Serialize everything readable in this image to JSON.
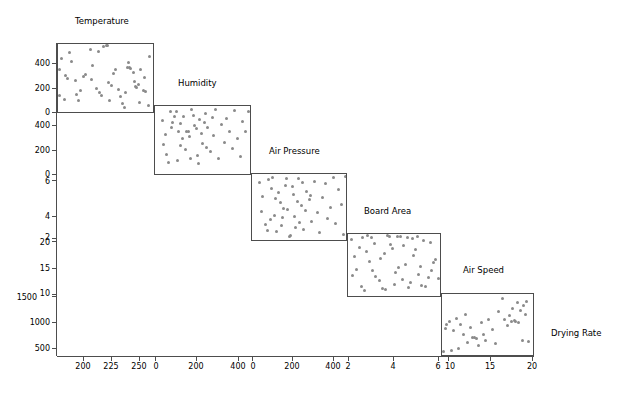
{
  "figure": {
    "type": "scatterplot-matrix",
    "background": "#ffffff",
    "point_color": "#8a8a8a",
    "frame_color": "#4d4d4d",
    "width": 640,
    "height": 396
  },
  "chart_data": {
    "type": "scatter",
    "title": "",
    "subtitle": "",
    "xlabel": "",
    "ylabel": "",
    "grid": false,
    "legend": "none",
    "layout": "staircase scatterplot matrix (lower-diagonal cascade), 5 scatter panels",
    "variables": [
      {
        "name": "Temperature",
        "role": "x-axis of panel 1",
        "ticks": [
          200,
          225,
          250
        ],
        "range": [
          185,
          262
        ]
      },
      {
        "name": "Humidity",
        "role": "y-axis of panel 1 / x-axis of panel 2",
        "ticks": [
          0,
          200,
          400
        ],
        "range": [
          -30,
          500
        ]
      },
      {
        "name": "Air Pressure",
        "role": "y-axis of panel 2 / x-axis of panel 3",
        "ticks": [
          0,
          200,
          400
        ],
        "range": [
          -30,
          500
        ]
      },
      {
        "name": "Board Area",
        "role": "y-axis of panel 3 / x-axis of panel 4",
        "ticks": [
          2,
          4,
          6
        ],
        "range": [
          1.0,
          6.6
        ]
      },
      {
        "name": "Air Speed",
        "role": "y-axis of panel 4 / x-axis of panel 5",
        "ticks": [
          10,
          15,
          20
        ],
        "range": [
          9.2,
          20.8
        ]
      },
      {
        "name": "Drying Rate",
        "role": "y-axis of panel 5",
        "ticks": [
          500,
          1000,
          1500
        ],
        "range": [
          330,
          1600
        ]
      }
    ],
    "panel_titles": [
      "Temperature",
      "Humidity",
      "Air Pressure",
      "Board Area",
      "Air Speed",
      "Drying Rate"
    ],
    "panels": [
      {
        "index": 1,
        "title": "Temperature",
        "x_variable": "Temperature",
        "y_variable": "Humidity",
        "x_ticks": [
          200,
          225,
          250
        ],
        "y_ticks": [
          0,
          200,
          400
        ],
        "n_points": 50,
        "points": [
          [
            188,
            390
          ],
          [
            186,
            300
          ],
          [
            191,
            253
          ],
          [
            193,
            228
          ],
          [
            199,
            212
          ],
          [
            200,
            108
          ],
          [
            203,
            137
          ],
          [
            207,
            265
          ],
          [
            211,
            460
          ],
          [
            213,
            330
          ],
          [
            216,
            153
          ],
          [
            219,
            120
          ],
          [
            222,
            477
          ],
          [
            224,
            492
          ],
          [
            225,
            487
          ],
          [
            227,
            60
          ],
          [
            228,
            175
          ],
          [
            232,
            300
          ],
          [
            234,
            148
          ],
          [
            237,
            35
          ],
          [
            239,
            6
          ],
          [
            241,
            318
          ],
          [
            243,
            315
          ],
          [
            244,
            312
          ],
          [
            247,
            210
          ],
          [
            248,
            167
          ],
          [
            249,
            163
          ],
          [
            250,
            185
          ],
          [
            252,
            300
          ],
          [
            254,
            140
          ],
          [
            256,
            133
          ],
          [
            258,
            20
          ],
          [
            186,
            96
          ],
          [
            190,
            70
          ],
          [
            194,
            430
          ],
          [
            196,
            360
          ],
          [
            202,
            58
          ],
          [
            206,
            246
          ],
          [
            212,
            224
          ],
          [
            218,
            440
          ],
          [
            220,
            102
          ],
          [
            226,
            198
          ],
          [
            230,
            272
          ],
          [
            236,
            90
          ],
          [
            240,
            125
          ],
          [
            242,
            355
          ],
          [
            246,
            280
          ],
          [
            251,
            44
          ],
          [
            255,
            238
          ],
          [
            259,
            400
          ]
        ]
      },
      {
        "index": 2,
        "title": "Humidity",
        "x_variable": "Humidity",
        "y_variable": "Air Pressure",
        "x_ticks": [
          0,
          200,
          400
        ],
        "y_ticks": [
          0,
          200,
          400
        ],
        "n_points": 50,
        "points": [
          [
            10,
            390
          ],
          [
            28,
            280
          ],
          [
            35,
            120
          ],
          [
            55,
            460
          ],
          [
            70,
            372
          ],
          [
            88,
            455
          ],
          [
            100,
            300
          ],
          [
            115,
            190
          ],
          [
            130,
            415
          ],
          [
            145,
            305
          ],
          [
            160,
            260
          ],
          [
            175,
            470
          ],
          [
            190,
            350
          ],
          [
            205,
            118
          ],
          [
            220,
            395
          ],
          [
            235,
            205
          ],
          [
            250,
            440
          ],
          [
            265,
            330
          ],
          [
            280,
            145
          ],
          [
            295,
            268
          ],
          [
            310,
            475
          ],
          [
            325,
            90
          ],
          [
            340,
            355
          ],
          [
            355,
            215
          ],
          [
            370,
            400
          ],
          [
            385,
            300
          ],
          [
            400,
            165
          ],
          [
            415,
            465
          ],
          [
            430,
            250
          ],
          [
            445,
            110
          ],
          [
            460,
            382
          ],
          [
            475,
            300
          ],
          [
            490,
            455
          ],
          [
            20,
            200
          ],
          [
            45,
            62
          ],
          [
            60,
            330
          ],
          [
            78,
            415
          ],
          [
            95,
            78
          ],
          [
            110,
            360
          ],
          [
            125,
            245
          ],
          [
            140,
            158
          ],
          [
            155,
            298
          ],
          [
            170,
            88
          ],
          [
            185,
            425
          ],
          [
            200,
            325
          ],
          [
            215,
            52
          ],
          [
            230,
            288
          ],
          [
            245,
            372
          ],
          [
            260,
            180
          ],
          [
            290,
            408
          ]
        ]
      },
      {
        "index": 3,
        "title": "Air Pressure",
        "x_variable": "Air Pressure",
        "y_variable": "Board Area",
        "x_ticks": [
          0,
          200,
          400
        ],
        "y_ticks": [
          2,
          4,
          6
        ],
        "n_points": 50,
        "points": [
          [
            12,
            5.9
          ],
          [
            30,
            4.7
          ],
          [
            48,
            2.3
          ],
          [
            62,
            6.1
          ],
          [
            80,
            5.4
          ],
          [
            95,
            3.1
          ],
          [
            110,
            1.7
          ],
          [
            128,
            4.2
          ],
          [
            142,
            2.9
          ],
          [
            158,
            5.6
          ],
          [
            172,
            3.6
          ],
          [
            188,
            1.4
          ],
          [
            202,
            4.9
          ],
          [
            218,
            2.1
          ],
          [
            232,
            6.2
          ],
          [
            248,
            3.9
          ],
          [
            262,
            1.9
          ],
          [
            278,
            5.1
          ],
          [
            292,
            4.4
          ],
          [
            308,
            2.6
          ],
          [
            322,
            6.0
          ],
          [
            338,
            3.3
          ],
          [
            352,
            1.6
          ],
          [
            368,
            4.6
          ],
          [
            382,
            5.8
          ],
          [
            398,
            2.8
          ],
          [
            412,
            3.8
          ],
          [
            428,
            6.3
          ],
          [
            442,
            2.4
          ],
          [
            458,
            5.3
          ],
          [
            472,
            4.0
          ],
          [
            486,
            1.5
          ],
          [
            498,
            6.4
          ],
          [
            22,
            3.4
          ],
          [
            55,
            1.8
          ],
          [
            72,
            2.7
          ],
          [
            88,
            6.3
          ],
          [
            105,
            4.5
          ],
          [
            120,
            5.0
          ],
          [
            136,
            2.2
          ],
          [
            150,
            3.7
          ],
          [
            166,
            6.2
          ],
          [
            180,
            1.3
          ],
          [
            196,
            5.5
          ],
          [
            212,
            3.0
          ],
          [
            226,
            4.3
          ],
          [
            240,
            2.5
          ],
          [
            256,
            5.9
          ],
          [
            270,
            3.5
          ],
          [
            300,
            4.8
          ]
        ]
      },
      {
        "index": 4,
        "title": "Board Area",
        "x_variable": "Board Area",
        "y_variable": "Air Speed",
        "x_ticks": [
          2,
          4,
          6
        ],
        "y_ticks": [
          10,
          15,
          20
        ],
        "n_points": 50,
        "points": [
          [
            1.2,
            19.8
          ],
          [
            1.5,
            14.2
          ],
          [
            1.8,
            11.0
          ],
          [
            2.1,
            17.5
          ],
          [
            2.4,
            20.1
          ],
          [
            2.7,
            12.8
          ],
          [
            3.0,
            16.3
          ],
          [
            3.3,
            10.4
          ],
          [
            3.6,
            18.9
          ],
          [
            3.9,
            13.6
          ],
          [
            4.2,
            20.4
          ],
          [
            4.5,
            15.1
          ],
          [
            4.8,
            11.7
          ],
          [
            5.1,
            17.9
          ],
          [
            5.4,
            14.8
          ],
          [
            5.7,
            10.9
          ],
          [
            6.0,
            19.3
          ],
          [
            6.3,
            16.0
          ],
          [
            6.5,
            12.4
          ],
          [
            1.3,
            13.1
          ],
          [
            1.7,
            18.2
          ],
          [
            2.0,
            10.2
          ],
          [
            2.3,
            15.6
          ],
          [
            2.6,
            19.0
          ],
          [
            2.9,
            12.1
          ],
          [
            3.2,
            17.1
          ],
          [
            3.5,
            20.3
          ],
          [
            3.8,
            11.4
          ],
          [
            4.1,
            14.5
          ],
          [
            4.4,
            18.6
          ],
          [
            4.7,
            10.7
          ],
          [
            5.0,
            16.8
          ],
          [
            5.3,
            13.3
          ],
          [
            5.6,
            19.6
          ],
          [
            5.9,
            12.6
          ],
          [
            6.2,
            15.4
          ],
          [
            1.4,
            16.6
          ],
          [
            1.9,
            20.2
          ],
          [
            2.5,
            13.9
          ],
          [
            3.1,
            10.6
          ],
          [
            3.7,
            18.0
          ],
          [
            4.3,
            12.2
          ],
          [
            4.9,
            19.9
          ],
          [
            5.5,
            11.2
          ],
          [
            6.1,
            14.0
          ],
          [
            2.2,
            20.5
          ],
          [
            4.0,
            20.4
          ],
          [
            4.6,
            20.2
          ],
          [
            3.4,
            20.5
          ],
          [
            5.2,
            20.3
          ]
        ]
      },
      {
        "index": 5,
        "title": "Air Speed",
        "x_variable": "Air Speed",
        "y_variable": "Drying Rate",
        "x_ticks": [
          10,
          15,
          20
        ],
        "y_ticks": [
          500,
          1000,
          1500
        ],
        "n_points": 40,
        "points": [
          [
            9.4,
            400
          ],
          [
            9.6,
            880
          ],
          [
            9.8,
            960
          ],
          [
            10.1,
            1020
          ],
          [
            10.4,
            430
          ],
          [
            10.7,
            830
          ],
          [
            11.0,
            1080
          ],
          [
            11.3,
            470
          ],
          [
            11.6,
            960
          ],
          [
            11.9,
            750
          ],
          [
            12.2,
            1180
          ],
          [
            12.5,
            600
          ],
          [
            12.8,
            900
          ],
          [
            13.1,
            700
          ],
          [
            13.4,
            690
          ],
          [
            13.6,
            670
          ],
          [
            13.9,
            520
          ],
          [
            14.2,
            1000
          ],
          [
            14.5,
            760
          ],
          [
            14.8,
            640
          ],
          [
            15.1,
            1060
          ],
          [
            15.6,
            870
          ],
          [
            16.0,
            560
          ],
          [
            16.4,
            1240
          ],
          [
            16.9,
            1510
          ],
          [
            17.2,
            1060
          ],
          [
            17.5,
            940
          ],
          [
            17.8,
            1150
          ],
          [
            18.0,
            1030
          ],
          [
            18.2,
            1300
          ],
          [
            18.4,
            1045
          ],
          [
            18.6,
            1020
          ],
          [
            18.8,
            1420
          ],
          [
            19.0,
            1000
          ],
          [
            19.2,
            1260
          ],
          [
            19.4,
            640
          ],
          [
            19.6,
            1360
          ],
          [
            19.8,
            1180
          ],
          [
            20.0,
            1450
          ],
          [
            20.2,
            620
          ]
        ]
      }
    ]
  },
  "axes": {
    "y_tick_labels": [
      "400",
      "200",
      "0",
      "400",
      "200",
      "0",
      "6",
      "4",
      "2",
      "20",
      "15",
      "10",
      "1500",
      "1000",
      "500"
    ],
    "x_tick_labels": [
      "200",
      "225",
      "250",
      "0",
      "200",
      "400",
      "0",
      "200",
      "400",
      "2",
      "4",
      "6",
      "10",
      "15",
      "20"
    ]
  }
}
